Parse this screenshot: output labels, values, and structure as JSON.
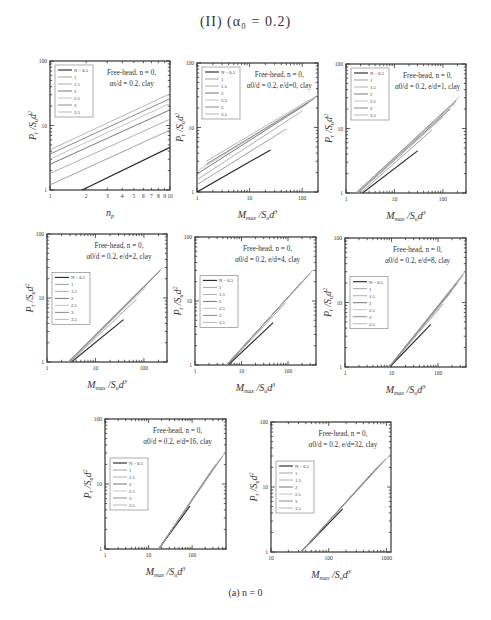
{
  "figure": {
    "title": "(II) (α₀ = 0.2)",
    "caption": "(a)   n = 0"
  },
  "legend_labels": [
    "N = 0.5",
    "1",
    "1.5",
    "2",
    "2.5",
    "3",
    "3.5"
  ],
  "series_colors": [
    "#222222",
    "#8a8a8a",
    "#9c9c9c",
    "#555555",
    "#b5b5b5",
    "#6f6f6f",
    "#a4a4a4"
  ],
  "chart_data": [
    {
      "type": "line",
      "panel": 1,
      "scale": "log-log",
      "annotation": [
        "Free-head,  n = 0,",
        "αs/d = 0.2,  clay"
      ],
      "xlabel": "n_p",
      "ylabel": "P_t / S_u d²",
      "xlim": [
        1,
        10
      ],
      "ylim": [
        1,
        100
      ],
      "xticks": [
        "1",
        "2",
        "3",
        "4",
        "5",
        "6",
        "7",
        "8",
        "9",
        "10"
      ],
      "yticks": [
        "1",
        "10",
        "100"
      ],
      "legend": [
        "N = 0.5",
        "1",
        "1.5",
        "2",
        "2.5",
        "3",
        "3.5"
      ],
      "legend_pos": "top-left",
      "series": [
        {
          "name": "0.5",
          "x": [
            1.85,
            10
          ],
          "y": [
            1.0,
            4.6
          ]
        },
        {
          "name": "1",
          "x": [
            1,
            10
          ],
          "y": [
            1.2,
            8.5
          ]
        },
        {
          "name": "1.5",
          "x": [
            1,
            10
          ],
          "y": [
            1.8,
            12.5
          ]
        },
        {
          "name": "2",
          "x": [
            1,
            10
          ],
          "y": [
            2.5,
            17.5
          ]
        },
        {
          "name": "2.5",
          "x": [
            1,
            10
          ],
          "y": [
            3.0,
            22
          ]
        },
        {
          "name": "3",
          "x": [
            1,
            10
          ],
          "y": [
            3.6,
            26
          ]
        },
        {
          "name": "3.5",
          "x": [
            1,
            10
          ],
          "y": [
            4.2,
            31
          ]
        }
      ]
    },
    {
      "type": "line",
      "panel": 2,
      "scale": "log-log",
      "annotation": [
        "Free-head,  n = 0,",
        "α0/d = 0.2,  e/d=0,  clay"
      ],
      "xlabel": "M_max / S_u d³",
      "ylabel": "P_t / S_u d²",
      "xlim": [
        1,
        200
      ],
      "ylim": [
        1,
        100
      ],
      "xticks": [
        "1",
        "10",
        "100"
      ],
      "yticks": [
        "1",
        "10",
        "100"
      ],
      "legend": [
        "N = 0.5",
        "1",
        "1.5",
        "2",
        "2.5",
        "3",
        "3.5"
      ],
      "legend_pos": "top-left",
      "series": [
        {
          "name": "0.5",
          "x": [
            1,
            25
          ],
          "y": [
            1.0,
            4.5
          ]
        },
        {
          "name": "1",
          "x": [
            1,
            50
          ],
          "y": [
            1.3,
            9.5
          ]
        },
        {
          "name": "1.5",
          "x": [
            1,
            100
          ],
          "y": [
            1.55,
            18
          ]
        },
        {
          "name": "2",
          "x": [
            1,
            130
          ],
          "y": [
            1.9,
            24
          ]
        },
        {
          "name": "2.5",
          "x": [
            1,
            160
          ],
          "y": [
            2.1,
            27
          ]
        },
        {
          "name": "3",
          "x": [
            1.5,
            180
          ],
          "y": [
            2.7,
            29
          ]
        },
        {
          "name": "3.5",
          "x": [
            1.5,
            200
          ],
          "y": [
            3.0,
            32
          ]
        }
      ]
    },
    {
      "type": "line",
      "panel": 3,
      "scale": "log-log",
      "annotation": [
        "Free-head,  n = 0,",
        "α0/d = 0.2,  e/d=1,  clay"
      ],
      "xlabel": "M_max / S_u d³",
      "ylabel": "P_t / S_u d²",
      "xlim": [
        1,
        300
      ],
      "ylim": [
        1,
        100
      ],
      "xticks": [
        "1",
        "10",
        "100"
      ],
      "yticks": [
        "1",
        "10",
        "100"
      ],
      "legend": [
        "N = 0.5",
        "1",
        "1.5",
        "2",
        "2.5",
        "3",
        "3.5"
      ],
      "legend_pos": "top-left",
      "series": [
        {
          "name": "0.5",
          "x": [
            2.2,
            30
          ],
          "y": [
            1.0,
            4.5
          ]
        },
        {
          "name": "1",
          "x": [
            2.0,
            60
          ],
          "y": [
            1.0,
            9.5
          ]
        },
        {
          "name": "1.5",
          "x": [
            1.8,
            100
          ],
          "y": [
            1.0,
            15
          ]
        },
        {
          "name": "2",
          "x": [
            1.7,
            140
          ],
          "y": [
            1.0,
            20
          ]
        },
        {
          "name": "2.5",
          "x": [
            1.7,
            170
          ],
          "y": [
            1.0,
            24
          ]
        },
        {
          "name": "3",
          "x": [
            1.6,
            190
          ],
          "y": [
            1.0,
            27
          ]
        },
        {
          "name": "3.5",
          "x": [
            1.6,
            220
          ],
          "y": [
            1.0,
            31
          ]
        }
      ]
    },
    {
      "type": "line",
      "panel": 4,
      "scale": "log-log",
      "annotation": [
        "Free-head,  n = 0,",
        "α0/d = 0.2,  e/d=2,  clay"
      ],
      "xlabel": "M_max / S_u d³",
      "ylabel": "P_t / S_u d²",
      "xlim": [
        1,
        300
      ],
      "ylim": [
        1,
        100
      ],
      "xticks": [
        "1",
        "10",
        "100"
      ],
      "yticks": [
        "1",
        "10",
        "100"
      ],
      "legend": [
        "N = 0.5",
        "1",
        "1.5",
        "2",
        "2.5",
        "3",
        "3.5"
      ],
      "legend_pos": "left",
      "series": [
        {
          "name": "0.5",
          "x": [
            3.2,
            38
          ],
          "y": [
            1.0,
            4.6
          ]
        },
        {
          "name": "1",
          "x": [
            3.0,
            70
          ],
          "y": [
            1.0,
            9.5
          ]
        },
        {
          "name": "1.5",
          "x": [
            2.9,
            110
          ],
          "y": [
            1.0,
            15
          ]
        },
        {
          "name": "2",
          "x": [
            2.8,
            150
          ],
          "y": [
            1.0,
            20
          ]
        },
        {
          "name": "2.5",
          "x": [
            2.8,
            190
          ],
          "y": [
            1.0,
            24
          ]
        },
        {
          "name": "3",
          "x": [
            2.7,
            220
          ],
          "y": [
            1.0,
            27
          ]
        },
        {
          "name": "3.5",
          "x": [
            2.7,
            250
          ],
          "y": [
            1.0,
            31
          ]
        }
      ]
    },
    {
      "type": "line",
      "panel": 5,
      "scale": "log-log",
      "annotation": [
        "Free-head,  n = 0,",
        "α0/d = 0.2,  e/d=4,  clay"
      ],
      "xlabel": "M_max / S_u d³",
      "ylabel": "P_t / S_u d²",
      "xlim": [
        1,
        400
      ],
      "ylim": [
        1,
        100
      ],
      "xticks": [
        "1",
        "10",
        "100"
      ],
      "yticks": [
        "1",
        "10",
        "100"
      ],
      "legend": [
        "N = 0.5",
        "1",
        "1.5",
        "2",
        "2.5",
        "3",
        "3.5"
      ],
      "legend_pos": "left",
      "series": [
        {
          "name": "0.5",
          "x": [
            5.2,
            48
          ],
          "y": [
            1.0,
            4.6
          ]
        },
        {
          "name": "1",
          "x": [
            5.0,
            90
          ],
          "y": [
            1.0,
            9.5
          ]
        },
        {
          "name": "1.5",
          "x": [
            4.9,
            140
          ],
          "y": [
            1.0,
            15
          ]
        },
        {
          "name": "2",
          "x": [
            4.8,
            200
          ],
          "y": [
            1.0,
            20
          ]
        },
        {
          "name": "2.5",
          "x": [
            4.8,
            250
          ],
          "y": [
            1.0,
            24
          ]
        },
        {
          "name": "3",
          "x": [
            4.7,
            300
          ],
          "y": [
            1.0,
            27
          ]
        },
        {
          "name": "3.5",
          "x": [
            4.7,
            350
          ],
          "y": [
            1.0,
            31
          ]
        }
      ]
    },
    {
      "type": "line",
      "panel": 6,
      "scale": "log-log",
      "annotation": [
        "Free-head,  n = 0,",
        "α0/d = 0.2,  e/d=8,  clay"
      ],
      "xlabel": "M_max / S_u d³",
      "ylabel": "P_t / S_u d²",
      "xlim": [
        1,
        400
      ],
      "ylim": [
        1,
        100
      ],
      "xticks": [
        "1",
        "10",
        "100"
      ],
      "yticks": [
        "1",
        "10",
        "100"
      ],
      "legend": [
        "N = 0.5",
        "1",
        "1.5",
        "2",
        "2.5",
        "3",
        "3.5"
      ],
      "legend_pos": "left",
      "series": [
        {
          "name": "0.5",
          "x": [
            9.2,
            70
          ],
          "y": [
            1.0,
            4.6
          ]
        },
        {
          "name": "1",
          "x": [
            9.0,
            130
          ],
          "y": [
            1.0,
            9.5
          ]
        },
        {
          "name": "1.5",
          "x": [
            9.0,
            200
          ],
          "y": [
            1.0,
            15
          ]
        },
        {
          "name": "2",
          "x": [
            8.9,
            260
          ],
          "y": [
            1.0,
            20
          ]
        },
        {
          "name": "2.5",
          "x": [
            8.9,
            310
          ],
          "y": [
            1.0,
            24
          ]
        },
        {
          "name": "3",
          "x": [
            8.8,
            350
          ],
          "y": [
            1.0,
            27
          ]
        },
        {
          "name": "3.5",
          "x": [
            8.8,
            390
          ],
          "y": [
            1.0,
            31
          ]
        }
      ]
    },
    {
      "type": "line",
      "panel": 7,
      "scale": "log-log",
      "annotation": [
        "Free-head,  n = 0,",
        "α0/d = 0.2,  e/d=16,  clay"
      ],
      "xlabel": "M_max / S_u d³",
      "ylabel": "P_t / S_u d²",
      "xlim": [
        1,
        600
      ],
      "ylim": [
        1,
        100
      ],
      "xticks": [
        "1",
        "10",
        "100"
      ],
      "yticks": [
        "1",
        "10",
        "100"
      ],
      "legend": [
        "N = 0.5",
        "1",
        "1.5",
        "2",
        "2.5",
        "3",
        "3.5"
      ],
      "legend_pos": "left",
      "series": [
        {
          "name": "0.5",
          "x": [
            17,
            90
          ],
          "y": [
            1.0,
            4.6
          ]
        },
        {
          "name": "1",
          "x": [
            17,
            170
          ],
          "y": [
            1.0,
            9.5
          ]
        },
        {
          "name": "1.5",
          "x": [
            17,
            260
          ],
          "y": [
            1.0,
            15
          ]
        },
        {
          "name": "2",
          "x": [
            17,
            350
          ],
          "y": [
            1.0,
            20
          ]
        },
        {
          "name": "2.5",
          "x": [
            17,
            430
          ],
          "y": [
            1.0,
            24
          ]
        },
        {
          "name": "3",
          "x": [
            17,
            500
          ],
          "y": [
            1.0,
            27
          ]
        },
        {
          "name": "3.5",
          "x": [
            17,
            580
          ],
          "y": [
            1.0,
            31
          ]
        }
      ]
    },
    {
      "type": "line",
      "panel": 8,
      "scale": "log-log",
      "annotation": [
        "Free-head,  n = 0,",
        "α0/d = 0.2,  e/d=32,  clay"
      ],
      "xlabel": "M_max / S_u d³",
      "ylabel": "P_t / S_u d²",
      "xlim": [
        10,
        1200
      ],
      "ylim": [
        1,
        100
      ],
      "xticks": [
        "10",
        "100",
        "1000"
      ],
      "yticks": [
        "1",
        "10",
        "100"
      ],
      "legend": [
        "N = 0.5",
        "1",
        "1.5",
        "2",
        "2.5",
        "3",
        "3.5"
      ],
      "legend_pos": "left",
      "series": [
        {
          "name": "0.5",
          "x": [
            33,
            175
          ],
          "y": [
            1.0,
            4.6
          ]
        },
        {
          "name": "1",
          "x": [
            33,
            330
          ],
          "y": [
            1.0,
            9.5
          ]
        },
        {
          "name": "1.5",
          "x": [
            33,
            520
          ],
          "y": [
            1.0,
            15
          ]
        },
        {
          "name": "2",
          "x": [
            33,
            690
          ],
          "y": [
            1.0,
            20
          ]
        },
        {
          "name": "2.5",
          "x": [
            33,
            840
          ],
          "y": [
            1.0,
            24
          ]
        },
        {
          "name": "3",
          "x": [
            33,
            960
          ],
          "y": [
            1.0,
            27
          ]
        },
        {
          "name": "3.5",
          "x": [
            33,
            1150
          ],
          "y": [
            1.0,
            31
          ]
        }
      ]
    }
  ]
}
